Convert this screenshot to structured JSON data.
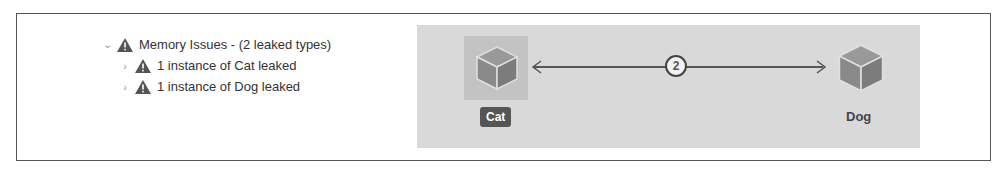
{
  "tree": {
    "root": {
      "label": "Memory Issues - (2 leaked types)",
      "expanded": true,
      "icon": "warning-icon"
    },
    "children": [
      {
        "label": "1 instance of Cat leaked",
        "icon": "warning-icon"
      },
      {
        "label": "1 instance of Dog leaked",
        "icon": "warning-icon"
      }
    ]
  },
  "graph": {
    "nodes": [
      {
        "name": "Cat",
        "selected": true,
        "icon": "cube-icon"
      },
      {
        "name": "Dog",
        "selected": false,
        "icon": "cube-icon"
      }
    ],
    "edge": {
      "count": "2"
    }
  }
}
